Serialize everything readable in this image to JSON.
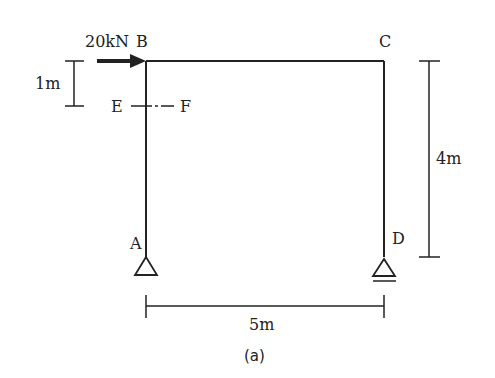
{
  "diagram": {
    "type": "portal-frame",
    "caption": "(a)",
    "load": {
      "label": "20kN",
      "direction": "right",
      "node": "B"
    },
    "nodes": {
      "A": "A",
      "B": "B",
      "C": "C",
      "D": "D",
      "E": "E",
      "F": "F"
    },
    "dimensions": {
      "load_offset": "1m",
      "height": "4m",
      "span": "5m"
    },
    "supports": {
      "A": "pin",
      "D": "roller"
    },
    "section_cut": "E-F",
    "colors": {
      "line": "#222222",
      "background": "#ffffff"
    }
  }
}
